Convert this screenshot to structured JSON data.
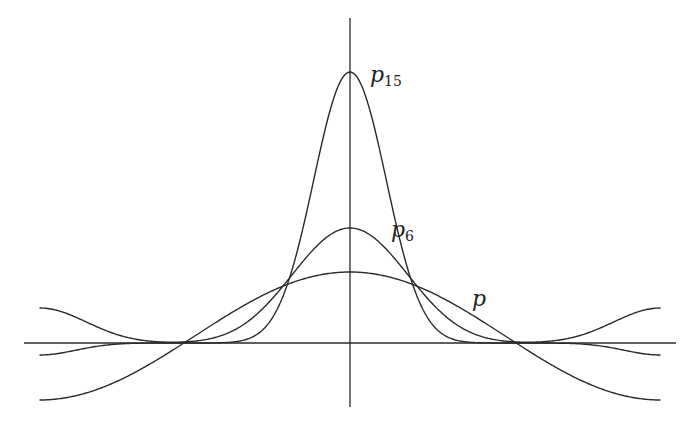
{
  "diagram": {
    "labels": {
      "p15_base": "p",
      "p15_sub": "15",
      "p6_base": "p",
      "p6_sub": "6",
      "p_base": "p"
    },
    "curves": [
      {
        "name": "p",
        "peak": 71,
        "ends": -57,
        "zero_crossing_fraction_of_pi": 0.535
      },
      {
        "name": "p6",
        "peak": 115,
        "ends": 35
      },
      {
        "name": "p15",
        "peak": 271,
        "ends": -12
      }
    ],
    "colors": {
      "stroke": "#2a2a2a",
      "background": "#ffffff"
    }
  }
}
